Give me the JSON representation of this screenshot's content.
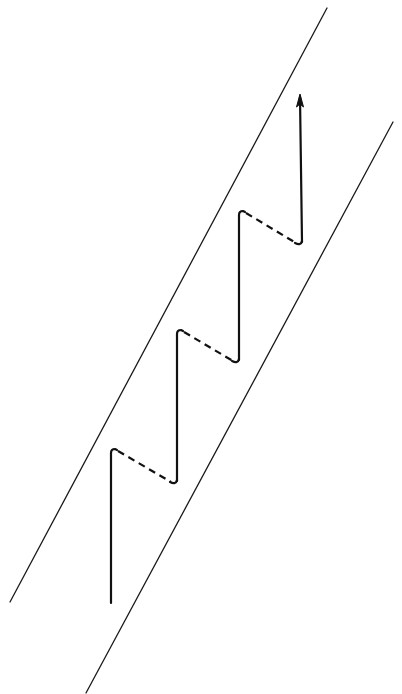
{
  "diagram": {
    "type": "zigzag-path-in-channel",
    "colors": {
      "background": "#ffffff",
      "stroke": "#111111"
    },
    "boundaries": [
      {
        "name": "left-boundary",
        "x1": 327,
        "y1": 8,
        "x2": 10,
        "y2": 602
      },
      {
        "name": "right-boundary",
        "x1": 393,
        "y1": 122,
        "x2": 86,
        "y2": 693
      }
    ],
    "path": {
      "start": [
        111,
        603
      ],
      "steps": [
        {
          "vertical_from": [
            111,
            603
          ],
          "corner": [
            111,
            450
          ],
          "dashed_to": [
            175,
            483
          ]
        },
        {
          "vertical_from": [
            177,
            480
          ],
          "corner": [
            177,
            331
          ],
          "dashed_to": [
            237,
            363
          ]
        },
        {
          "vertical_from": [
            239,
            360
          ],
          "corner": [
            239,
            212
          ],
          "dashed_to": [
            300,
            244
          ]
        }
      ],
      "final_arrow": {
        "from": [
          302,
          241
        ],
        "to": [
          300,
          95
        ]
      }
    }
  }
}
